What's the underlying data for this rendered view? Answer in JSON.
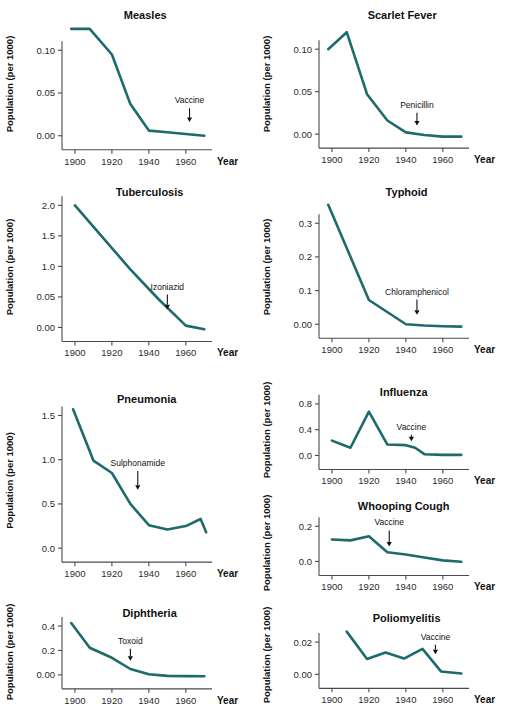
{
  "figure": {
    "background": "#ffffff",
    "line_color": "#1d6b6b",
    "axis_color": "#4a4a4a",
    "text_color": "#111111",
    "common_ylabel": "Population (per 1000)",
    "common_xlabel": "Year",
    "common_xticks": [
      "1900",
      "1920",
      "1940",
      "1960"
    ]
  },
  "chart_data": [
    {
      "id": "measles",
      "type": "line",
      "title": "Measles",
      "xlabel": "Year",
      "ylabel": "Population (per 1000)",
      "xlim": [
        1893,
        1972
      ],
      "ylim": [
        -0.012,
        0.133
      ],
      "xticks": [
        1900,
        1920,
        1940,
        1960
      ],
      "xticklabels": [
        "1900",
        "1920",
        "1940",
        "1960"
      ],
      "yticks": [
        0.0,
        0.05,
        0.1
      ],
      "yticklabels": [
        "0.00",
        "0.05",
        "0.10"
      ],
      "x": [
        1898,
        1908,
        1920,
        1930,
        1940,
        1950,
        1960,
        1970
      ],
      "values": [
        0.125,
        0.125,
        0.095,
        0.037,
        0.006,
        0.004,
        0.002,
        0.0
      ],
      "annotations": [
        {
          "label": "Vaccine",
          "x": 1962,
          "y": 0.038,
          "arrow_to_y": 0.016
        }
      ]
    },
    {
      "id": "scarlet-fever",
      "type": "line",
      "title": "Scarlet Fever",
      "xlabel": "Year",
      "ylabel": "Population (per 1000)",
      "xlim": [
        1893,
        1972
      ],
      "ylim": [
        -0.014,
        0.132
      ],
      "xticks": [
        1900,
        1920,
        1940,
        1960
      ],
      "xticklabels": [
        "1900",
        "1920",
        "1940",
        "1960"
      ],
      "yticks": [
        0.0,
        0.05,
        0.1
      ],
      "yticklabels": [
        "0.00",
        "0.05",
        "0.10"
      ],
      "x": [
        1898,
        1908,
        1919,
        1930,
        1940,
        1950,
        1960,
        1970
      ],
      "values": [
        0.1,
        0.12,
        0.047,
        0.016,
        0.002,
        -0.001,
        -0.003,
        -0.003
      ],
      "annotations": [
        {
          "label": "Penicillin",
          "x": 1946,
          "y": 0.031,
          "arrow_to_y": 0.01
        }
      ]
    },
    {
      "id": "tuberculosis",
      "type": "line",
      "title": "Tuberculosis",
      "xlabel": "Year",
      "ylabel": "Population (per 1000)",
      "xlim": [
        1893,
        1972
      ],
      "ylim": [
        -0.14,
        2.12
      ],
      "xticks": [
        1900,
        1920,
        1940,
        1960
      ],
      "xticklabels": [
        "1900",
        "1920",
        "1940",
        "1960"
      ],
      "yticks": [
        0.0,
        0.5,
        1.0,
        1.5,
        2.0
      ],
      "yticklabels": [
        "0.00",
        "0.05",
        "1.0",
        "1.5",
        "2.0"
      ],
      "x": [
        1900,
        1930,
        1945,
        1960,
        1970
      ],
      "values": [
        2.0,
        0.95,
        0.47,
        0.03,
        -0.03
      ],
      "annotations": [
        {
          "label": "Izoniazid",
          "x": 1950,
          "y": 0.62,
          "arrow_to_y": 0.3
        }
      ]
    },
    {
      "id": "typhoid",
      "type": "line",
      "title": "Typhoid",
      "xlabel": "Year",
      "ylabel": "Population (per 1000)",
      "xlim": [
        1893,
        1972
      ],
      "ylim": [
        -0.035,
        0.375
      ],
      "xticks": [
        1900,
        1920,
        1940,
        1960
      ],
      "xticklabels": [
        "1900",
        "1920",
        "1940",
        "1960"
      ],
      "yticks": [
        0.0,
        0.1,
        0.2,
        0.3
      ],
      "yticklabels": [
        "0.00",
        "0.1",
        "0.2",
        "0.3"
      ],
      "x": [
        1898,
        1920,
        1940,
        1950,
        1960,
        1970
      ],
      "values": [
        0.355,
        0.072,
        0.0,
        -0.004,
        -0.006,
        -0.007
      ],
      "annotations": [
        {
          "label": "Chloramphenicol",
          "x": 1946,
          "y": 0.088,
          "arrow_to_y": 0.028
        }
      ]
    },
    {
      "id": "pneumonia",
      "type": "line",
      "title": "Pneumonia",
      "xlabel": "Year",
      "ylabel": "Population (per 1000)",
      "xlim": [
        1893,
        1972
      ],
      "ylim": [
        -0.1,
        1.63
      ],
      "xticks": [
        1900,
        1920,
        1940,
        1960
      ],
      "xticklabels": [
        "1900",
        "1920",
        "1940",
        "1960"
      ],
      "yticks": [
        0.0,
        0.5,
        1.0,
        1.5
      ],
      "yticklabels": [
        "0.0",
        "0.5",
        "1.0",
        "1.5"
      ],
      "x": [
        1899,
        1910,
        1920,
        1930,
        1940,
        1950,
        1960,
        1968,
        1971
      ],
      "values": [
        1.57,
        0.99,
        0.85,
        0.5,
        0.26,
        0.21,
        0.25,
        0.33,
        0.18
      ],
      "annotations": [
        {
          "label": "Sulphonamide",
          "x": 1934,
          "y": 0.93,
          "arrow_to_y": 0.66
        }
      ]
    },
    {
      "id": "influenza",
      "type": "line",
      "title": "Influenza",
      "xlabel": "Year",
      "ylabel": "Population (per 1000)",
      "xlim": [
        1893,
        1972
      ],
      "ylim": [
        -0.07,
        0.86
      ],
      "xticks": [
        1900,
        1920,
        1940,
        1960
      ],
      "xticklabels": [
        "1900",
        "1920",
        "1940",
        "1960"
      ],
      "yticks": [
        0.0,
        0.4,
        0.8
      ],
      "yticklabels": [
        "0.0",
        "0.4",
        "0.8"
      ],
      "x": [
        1900,
        1910,
        1920,
        1930,
        1940,
        1945,
        1950,
        1960,
        1970
      ],
      "values": [
        0.23,
        0.12,
        0.68,
        0.17,
        0.16,
        0.12,
        0.02,
        0.01,
        0.01
      ],
      "annotations": [
        {
          "label": "Vaccine",
          "x": 1943,
          "y": 0.4,
          "arrow_to_y": 0.22
        }
      ]
    },
    {
      "id": "whooping-cough",
      "type": "line",
      "title": "Whooping Cough",
      "xlabel": "Year",
      "ylabel": "Population (per 1000)",
      "xlim": [
        1893,
        1972
      ],
      "ylim": [
        -0.06,
        0.27
      ],
      "xticks": [
        1900,
        1920,
        1940,
        1960
      ],
      "xticklabels": [
        "1900",
        "1920",
        "1940",
        "1960"
      ],
      "yticks": [
        0.0,
        0.2
      ],
      "yticklabels": [
        "0.0",
        "0.2"
      ],
      "x": [
        1900,
        1910,
        1920,
        1930,
        1940,
        1950,
        1960,
        1970
      ],
      "values": [
        0.125,
        0.12,
        0.143,
        0.052,
        0.04,
        0.022,
        0.006,
        -0.002
      ],
      "annotations": [
        {
          "label": "Vaccine",
          "x": 1931,
          "y": 0.205,
          "arrow_to_y": 0.085
        }
      ]
    },
    {
      "id": "diphtheria",
      "type": "line",
      "title": "Diphtheria",
      "xlabel": "Year",
      "ylabel": "Population (per 1000)",
      "xlim": [
        1893,
        1972
      ],
      "ylim": [
        -0.075,
        0.45
      ],
      "xticks": [
        1900,
        1920,
        1940,
        1960
      ],
      "xticklabels": [
        "1900",
        "1920",
        "1940",
        "1960"
      ],
      "yticks": [
        0.0,
        0.2,
        0.4
      ],
      "yticklabels": [
        "0.00",
        "0.2",
        "0.4"
      ],
      "x": [
        1898,
        1908,
        1920,
        1930,
        1940,
        1950,
        1960,
        1970
      ],
      "values": [
        0.425,
        0.222,
        0.14,
        0.048,
        0.005,
        -0.008,
        -0.01,
        -0.011
      ],
      "annotations": [
        {
          "label": "Toxoid",
          "x": 1930,
          "y": 0.255,
          "arrow_to_y": 0.115
        }
      ]
    },
    {
      "id": "poliomyelitis",
      "type": "line",
      "title": "Poliomyelitis",
      "xlabel": "Year",
      "ylabel": "Population (per 1000)",
      "xlim": [
        1893,
        1972
      ],
      "ylim": [
        -0.006,
        0.03
      ],
      "xticks": [
        1900,
        1920,
        1940,
        1960
      ],
      "xticklabels": [
        "1900",
        "1920",
        "1940",
        "1960"
      ],
      "yticks": [
        0.0,
        0.02
      ],
      "yticklabels": [
        "0.00",
        "0.02"
      ],
      "x": [
        1908,
        1919,
        1929,
        1939,
        1949,
        1959,
        1970
      ],
      "values": [
        0.0265,
        0.0095,
        0.0135,
        0.0098,
        0.0158,
        0.0018,
        0.0005
      ],
      "annotations": [
        {
          "label": "Vaccine",
          "x": 1956,
          "y": 0.0215,
          "arrow_to_y": 0.0125
        }
      ]
    }
  ],
  "layout": {
    "panels": [
      {
        "id": "measles",
        "left": 0,
        "top": 0,
        "width": 256,
        "height": 176,
        "title_x": 0.57,
        "title_y": 15
      },
      {
        "id": "scarlet-fever",
        "left": 257,
        "top": 0,
        "width": 256,
        "height": 176,
        "title_x": 0.57,
        "title_y": 15
      },
      {
        "id": "tuberculosis",
        "left": 0,
        "top": 176,
        "width": 256,
        "height": 190,
        "title_x": 0.6,
        "title_y": 16
      },
      {
        "id": "typhoid",
        "left": 257,
        "top": 176,
        "width": 256,
        "height": 190,
        "title_x": 0.6,
        "title_y": 16
      },
      {
        "id": "pneumonia",
        "left": 0,
        "top": 382,
        "width": 256,
        "height": 205,
        "title_x": 0.58,
        "title_y": 17
      },
      {
        "id": "influenza",
        "left": 257,
        "top": 378,
        "width": 256,
        "height": 112,
        "title_x": 0.58,
        "title_y": 14
      },
      {
        "id": "whooping-cough",
        "left": 257,
        "top": 492,
        "width": 256,
        "height": 110,
        "title_x": 0.58,
        "title_y": 14
      },
      {
        "id": "diphtheria",
        "left": 0,
        "top": 598,
        "width": 256,
        "height": 116,
        "title_x": 0.6,
        "title_y": 15
      },
      {
        "id": "poliomyelitis",
        "left": 257,
        "top": 604,
        "width": 256,
        "height": 110,
        "title_x": 0.6,
        "title_y": 14
      }
    ]
  }
}
